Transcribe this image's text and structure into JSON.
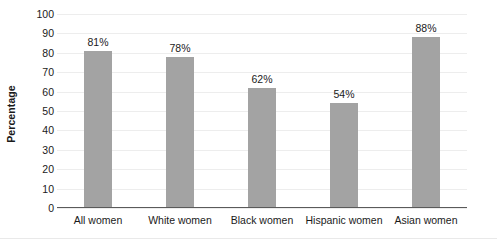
{
  "chart_data": {
    "type": "bar",
    "title": "",
    "subtitle": "",
    "xlabel": "",
    "ylabel": "Percentage",
    "categories": [
      "All women",
      "White women",
      "Black women",
      "Hispanic women",
      "Asian women"
    ],
    "values": [
      81,
      78,
      62,
      54,
      88
    ],
    "data_labels": [
      "81%",
      "78%",
      "62%",
      "54%",
      "88%"
    ],
    "ylim": [
      0,
      100
    ],
    "ytick_step": 10,
    "ytick_labels": [
      "100",
      "90",
      "80",
      "70",
      "60",
      "50",
      "40",
      "30",
      "20",
      "10",
      "0"
    ],
    "grid": true,
    "grid_axis": "y",
    "legend": false,
    "legend_position": "none",
    "series": [
      {
        "name": "Percentage",
        "values": [
          81,
          78,
          62,
          54,
          88
        ]
      }
    ]
  },
  "style": {
    "bar_color": "#a3a3a3",
    "grid_color": "#ededed",
    "axis_color": "#5a5a5a",
    "text_color": "#1a1a1a",
    "background": "#ffffff"
  }
}
